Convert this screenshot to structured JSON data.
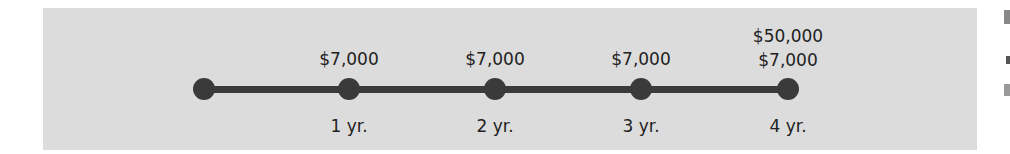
{
  "timeline": {
    "points": [
      {
        "x": 204,
        "label_above": [],
        "label_below": ""
      },
      {
        "x": 349,
        "label_above": [
          "$7,000"
        ],
        "label_below": "1 yr."
      },
      {
        "x": 495,
        "label_above": [
          "$7,000"
        ],
        "label_below": "2 yr."
      },
      {
        "x": 641,
        "label_above": [
          "$7,000"
        ],
        "label_below": "3 yr."
      },
      {
        "x": 788,
        "label_above": [
          "$50,000",
          "$7,000"
        ],
        "label_below": "4 yr."
      }
    ]
  },
  "colors": {
    "panel": "#dcdcdc",
    "line": "#3a3a3a",
    "text": "#222222"
  }
}
